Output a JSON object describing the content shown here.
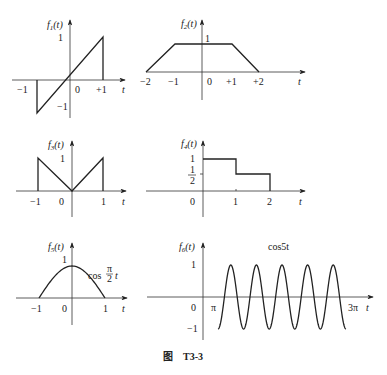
{
  "caption": "图    T3-3",
  "chart_data": [
    {
      "type": "line",
      "name": "f1",
      "ylabel": "f₁(t)",
      "xlabel": "t",
      "x_ticks": [
        "−1",
        "0",
        "+1"
      ],
      "y_ticks": [
        "1",
        "−1"
      ],
      "points": [
        [
          -1,
          0
        ],
        [
          -1,
          -1
        ],
        [
          1,
          1
        ],
        [
          1,
          0
        ]
      ],
      "description": "ramp f1(t)=t for -1<t<1, zero elsewhere"
    },
    {
      "type": "line",
      "name": "f2",
      "ylabel": "f₂(t)",
      "xlabel": "t",
      "x_ticks": [
        "−2",
        "−1",
        "0",
        "+1",
        "+2"
      ],
      "y_ticks": [
        "1"
      ],
      "points": [
        [
          -2,
          0
        ],
        [
          -1,
          1
        ],
        [
          1,
          1
        ],
        [
          2,
          0
        ]
      ],
      "description": "trapezoid"
    },
    {
      "type": "line",
      "name": "f3",
      "ylabel": "f₃(t)",
      "xlabel": "t",
      "x_ticks": [
        "−1",
        "0",
        "1"
      ],
      "y_ticks": [
        "1"
      ],
      "points": [
        [
          -1,
          0
        ],
        [
          -1,
          1
        ],
        [
          0,
          0
        ],
        [
          1,
          1
        ],
        [
          1,
          0
        ]
      ],
      "description": "|t| for -1<t<1"
    },
    {
      "type": "line",
      "name": "f4",
      "ylabel": "f₄(t)",
      "xlabel": "t",
      "x_ticks": [
        "0",
        "1",
        "2"
      ],
      "y_ticks": [
        "1",
        "1/2"
      ],
      "points": [
        [
          0,
          1
        ],
        [
          1,
          1
        ],
        [
          1,
          0.5
        ],
        [
          2,
          0.5
        ],
        [
          2,
          0
        ]
      ],
      "description": "staircase"
    },
    {
      "type": "line",
      "name": "f5",
      "ylabel": "f₅(t)",
      "xlabel": "t",
      "x_ticks": [
        "−1",
        "0",
        "1"
      ],
      "y_ticks": [
        "1"
      ],
      "annotation": "cos(π/2)t",
      "function": "cos(pi/2*t), -1<=t<=1",
      "description": "half cosine pulse"
    },
    {
      "type": "line",
      "name": "f6",
      "ylabel": "f₆(t)",
      "xlabel": "t",
      "x_ticks": [
        "0",
        "π",
        "3π"
      ],
      "y_ticks": [
        "1",
        "−1"
      ],
      "annotation": "cos5t",
      "function": "cos(5t), pi<=t<=3pi",
      "description": "cosine segment, 5 cycles"
    }
  ],
  "labels": {
    "f1": {
      "y": "f",
      "sub": "1",
      "arg": "(t)",
      "t": "t",
      "neg1x": "−1",
      "zero": "0",
      "pos1": "+1",
      "one": "1",
      "neg1y": "−1"
    },
    "f2": {
      "y": "f",
      "sub": "2",
      "arg": "(t)",
      "t": "t",
      "m2": "−2",
      "m1": "−1",
      "zero": "0",
      "p1": "+1",
      "p2": "+2",
      "one": "1"
    },
    "f3": {
      "y": "f",
      "sub": "3",
      "arg": "(t)",
      "t": "t",
      "m1": "−1",
      "zero": "0",
      "p1": "1",
      "one": "1"
    },
    "f4": {
      "y": "f",
      "sub": "4",
      "arg": "(t)",
      "t": "t",
      "zero": "0",
      "p1": "1",
      "p2": "2",
      "one": "1",
      "half_num": "1",
      "half_den": "2"
    },
    "f5": {
      "y": "f",
      "sub": "5",
      "arg": "(t)",
      "t": "t",
      "m1": "−1",
      "zero": "0",
      "p1": "1",
      "one": "1",
      "cos": "cos",
      "pi": "π",
      "two": "2",
      "tvar": "t"
    },
    "f6": {
      "y": "f",
      "sub": "6",
      "arg": "(t)",
      "t": "t",
      "zero": "0",
      "pi": "π",
      "three_pi": "3π",
      "one": "1",
      "neg1": "−1",
      "cos5t": "cos5t"
    }
  }
}
